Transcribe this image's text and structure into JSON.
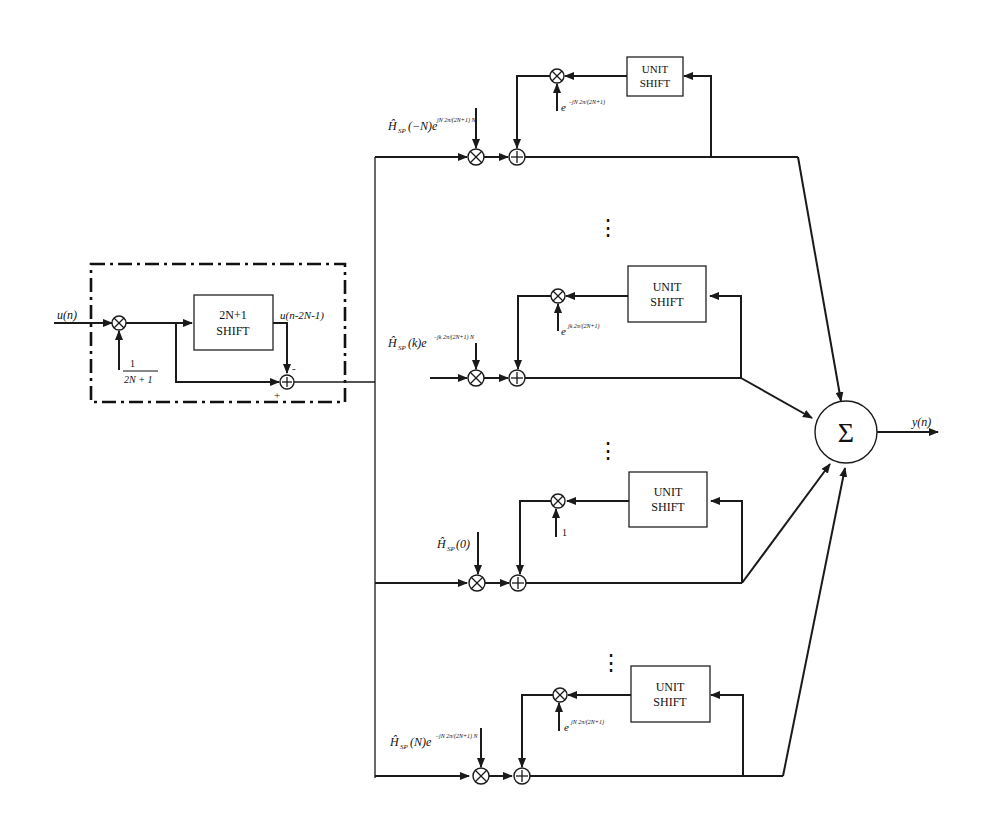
{
  "diagram": {
    "input_label": "u(n)",
    "output_label": "y(n)",
    "prefilter": {
      "shift_box": {
        "line1": "2N+1",
        "line2": "SHIFT"
      },
      "delayed_label": "u(n-2N-1)",
      "gain_num": "1",
      "gain_den": "2N + 1",
      "minus_sign": "-",
      "plus_sign": "+"
    },
    "sum_symbol": "Σ",
    "ellipsis": "⋮",
    "branches": [
      {
        "coef_label": "Ĥ_SP(−N) e^{jN·2π/(2N+1)·N}",
        "coef_main": "Ĥ",
        "coef_sub": "SP",
        "coef_arg": "(−N)e",
        "coef_exp": "jN 2π/(2N+1) N",
        "feedback_label": "e",
        "feedback_exp": "−jN 2π/(2N+1)",
        "box": {
          "line1": "UNIT",
          "line2": "SHIFT"
        }
      },
      {
        "coef_label": "Ĥ_SP(k) e^{−jk·2π/(2N+1)·N}",
        "coef_main": "Ĥ",
        "coef_sub": "SP",
        "coef_arg": "(k)e",
        "coef_exp": "−jk 2π/(2N+1) N",
        "feedback_label": "e",
        "feedback_exp": "jk 2π/(2N+1)",
        "box": {
          "line1": "UNIT",
          "line2": "SHIFT"
        }
      },
      {
        "coef_label": "Ĥ_SP(0)",
        "coef_main": "Ĥ",
        "coef_sub": "SP",
        "coef_arg": "(0)",
        "coef_exp": "",
        "feedback_label": "1",
        "feedback_exp": "",
        "box": {
          "line1": "UNIT",
          "line2": "SHIFT"
        }
      },
      {
        "coef_label": "Ĥ_SP(N) e^{−jN·2π/(2N+1)·N}",
        "coef_main": "Ĥ",
        "coef_sub": "SP",
        "coef_arg": "(N)e",
        "coef_exp": "−jN 2π/(2N+1) N",
        "feedback_label": "e",
        "feedback_exp": "jN 2π/(2N+1)",
        "box": {
          "line1": "UNIT",
          "line2": "SHIFT"
        }
      }
    ],
    "colors": {
      "ink": "#1a1a1a",
      "background": "#ffffff"
    }
  }
}
